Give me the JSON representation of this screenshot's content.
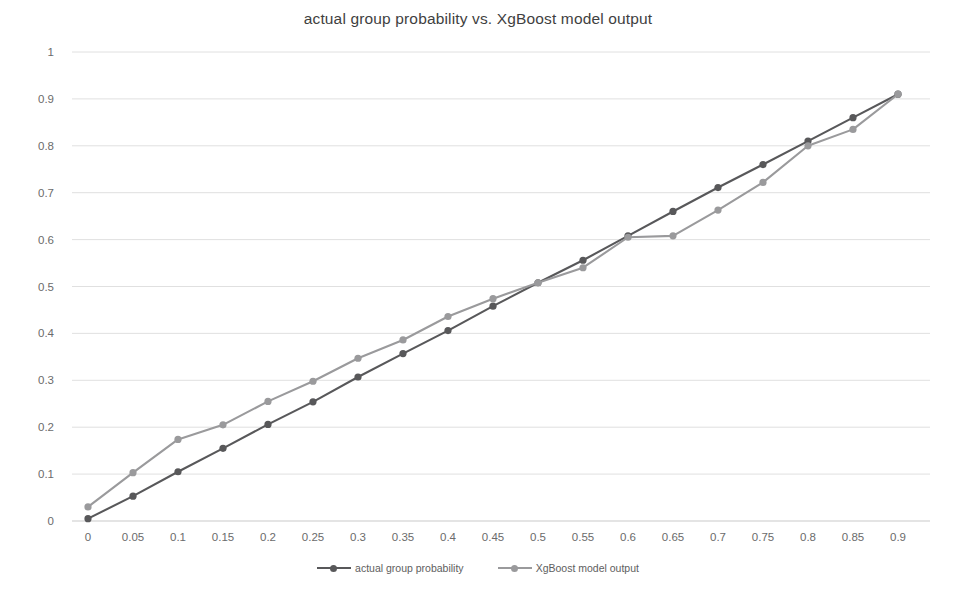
{
  "chart_data": {
    "type": "line",
    "title": "actual group probability vs. XgBoost model output",
    "xlabel": "",
    "ylabel": "",
    "xlim": [
      0,
      0.9
    ],
    "ylim": [
      0,
      1
    ],
    "grid": true,
    "grid_axis": "y",
    "legend_position": "bottom",
    "x": [
      0,
      0.05,
      0.1,
      0.15,
      0.2,
      0.25,
      0.3,
      0.35,
      0.4,
      0.45,
      0.5,
      0.55,
      0.6,
      0.65,
      0.7,
      0.75,
      0.8,
      0.85,
      0.9
    ],
    "categories": [
      "0",
      "0.05",
      "0.1",
      "0.15",
      "0.2",
      "0.25",
      "0.3",
      "0.35",
      "0.4",
      "0.45",
      "0.5",
      "0.55",
      "0.6",
      "0.65",
      "0.7",
      "0.75",
      "0.8",
      "0.85",
      "0.9"
    ],
    "xticks": [
      "0",
      "0.05",
      "0.1",
      "0.15",
      "0.2",
      "0.25",
      "0.3",
      "0.35",
      "0.4",
      "0.45",
      "0.5",
      "0.55",
      "0.6",
      "0.65",
      "0.7",
      "0.75",
      "0.8",
      "0.85",
      "0.9"
    ],
    "yticks": [
      "0",
      "0.1",
      "0.2",
      "0.3",
      "0.4",
      "0.5",
      "0.6",
      "0.7",
      "0.8",
      "0.9",
      "1"
    ],
    "ytick_values": [
      0,
      0.1,
      0.2,
      0.3,
      0.4,
      0.5,
      0.6,
      0.7,
      0.8,
      0.9,
      1
    ],
    "series": [
      {
        "name": "actual group probability",
        "color": "#58585a",
        "marker": "circle",
        "values": [
          0.005,
          0.053,
          0.105,
          0.155,
          0.206,
          0.254,
          0.307,
          0.357,
          0.406,
          0.458,
          0.508,
          0.556,
          0.608,
          0.66,
          0.711,
          0.76,
          0.81,
          0.86,
          0.91
        ]
      },
      {
        "name": "XgBoost model output",
        "color": "#9a9a9c",
        "marker": "circle",
        "values": [
          0.03,
          0.103,
          0.174,
          0.205,
          0.255,
          0.298,
          0.347,
          0.386,
          0.436,
          0.474,
          0.508,
          0.54,
          0.605,
          0.608,
          0.663,
          0.722,
          0.8,
          0.835,
          0.91
        ]
      }
    ]
  }
}
